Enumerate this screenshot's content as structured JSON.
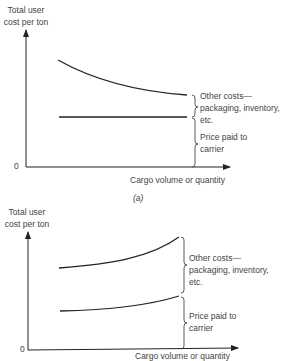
{
  "figure_a": {
    "ylabel_line1": "Total user",
    "ylabel_line2": "cost per ton",
    "origin": "0",
    "xlabel": "Cargo volume or quantity",
    "brace_upper_line1": "Other costs—",
    "brace_upper_line2": "packaging, inventory,",
    "brace_upper_line3": "etc.",
    "brace_lower_line1": "Price paid to",
    "brace_lower_line2": "carrier",
    "caption": "(a)"
  },
  "figure_b": {
    "ylabel_line1": "Total user",
    "ylabel_line2": "cost per ton",
    "origin": "0",
    "xlabel": "Cargo volume or quantity",
    "brace_upper_line1": "Other costs—",
    "brace_upper_line2": "packaging, inventory,",
    "brace_upper_line3": "etc.",
    "brace_lower_line1": "Price paid to",
    "brace_lower_line2": "carrier"
  }
}
